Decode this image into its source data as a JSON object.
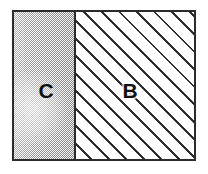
{
  "figure": {
    "frame": {
      "border_color": "#2b2b2b",
      "background_color": "#ffffff"
    },
    "regions": [
      {
        "id": "region-c",
        "label": "C",
        "fill": "stipple-gray",
        "fill_color": "#b9b9b9",
        "position": "left",
        "width_fraction": "0.33"
      },
      {
        "id": "region-b",
        "label": "B",
        "fill": "diagonal-hatch-45",
        "fill_color": "#ffffff",
        "hatch_color": "#2e2e2e",
        "position": "right",
        "width_fraction": "0.67"
      }
    ],
    "divider": {
      "orientation": "vertical",
      "color": "#2b2b2b"
    }
  }
}
